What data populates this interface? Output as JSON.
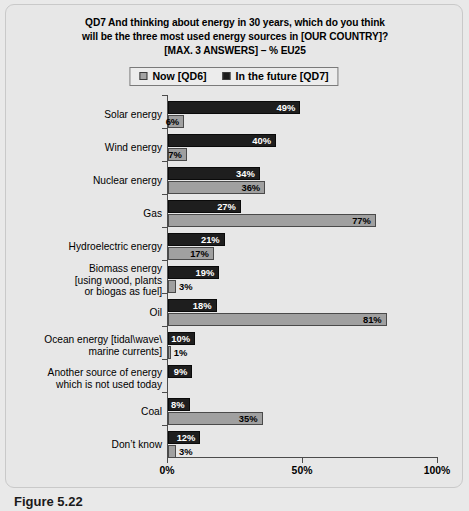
{
  "chart_data": {
    "type": "bar",
    "orientation": "horizontal",
    "title": "QD7 And thinking about energy in 30 years, which do you think will be the three most used energy sources in [OUR COUNTRY]? [MAX. 3 ANSWERS] – % EU25",
    "title_lines": [
      "QD7 And thinking about energy in 30 years, which do you think",
      "will be the three most used energy sources in [OUR COUNTRY]?",
      "[MAX. 3 ANSWERS] – % EU25"
    ],
    "xlabel": "",
    "ylabel": "",
    "xlim": [
      0,
      100
    ],
    "xticks": [
      0,
      50,
      100
    ],
    "xtick_labels": [
      "0%",
      "50%",
      "100%"
    ],
    "grid": false,
    "legend_position": "top-center",
    "categories": [
      "Solar energy",
      "Wind energy",
      "Nuclear energy",
      "Gas",
      "Hydroelectric energy",
      "Biomass energy [using wood, plants or biogas as fuel]",
      "Oil",
      "Ocean energy [tidal\\wave\\ marine currents]",
      "Another source of energy which is not used today",
      "Coal",
      "Don’t know"
    ],
    "category_lines": [
      [
        "Solar energy"
      ],
      [
        "Wind energy"
      ],
      [
        "Nuclear energy"
      ],
      [
        "Gas"
      ],
      [
        "Hydroelectric energy"
      ],
      [
        "Biomass energy",
        "[using wood, plants",
        "or biogas as fuel]"
      ],
      [
        "Oil"
      ],
      [
        "Ocean energy [tidal\\wave\\",
        "marine currents]"
      ],
      [
        "Another source of energy",
        "which is not used today"
      ],
      [
        "Coal"
      ],
      [
        "Don’t know"
      ]
    ],
    "series": [
      {
        "name": "In the future [QD7]",
        "key": "future",
        "color": "#1e1e1e",
        "values": [
          49,
          40,
          34,
          27,
          21,
          19,
          18,
          10,
          9,
          8,
          12
        ],
        "labels": [
          "49%",
          "40%",
          "34%",
          "27%",
          "21%",
          "19%",
          "18%",
          "10%",
          "9%",
          "8%",
          "12%"
        ]
      },
      {
        "name": "Now [QD6]",
        "key": "now",
        "color": "#a0a0a0",
        "values": [
          6,
          7,
          36,
          77,
          17,
          3,
          81,
          1,
          0,
          35,
          3
        ],
        "labels": [
          "6%",
          "7%",
          "36%",
          "77%",
          "17%",
          "3%",
          "81%",
          "1%",
          "",
          "35%",
          "3%"
        ]
      }
    ]
  },
  "legend": {
    "items": [
      {
        "label": "Now [QD6]",
        "swatch": "now-swatch",
        "color": "#a3a3a3"
      },
      {
        "label": "In the future [QD7]",
        "swatch": "future-swatch",
        "color": "#1c1c1c"
      }
    ]
  },
  "caption": "Figure 5.22"
}
